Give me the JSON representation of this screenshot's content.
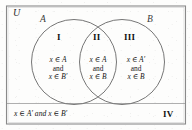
{
  "diagram": {
    "universe_label": "U",
    "set_a_label": "A",
    "set_b_label": "B",
    "colors": {
      "outline": "#7a7a7a",
      "circle_stroke": "#6f6f6f",
      "text": "#151515",
      "background": "#fdfdfc"
    },
    "regions": [
      {
        "numeral": "I",
        "name": "a-only",
        "line1": "x ∈ A",
        "line2": "and",
        "line3": "x ∈ B′"
      },
      {
        "numeral": "II",
        "name": "intersection",
        "line1": "x ∈ A",
        "line2": "and",
        "line3": "x ∈ B"
      },
      {
        "numeral": "III",
        "name": "b-only",
        "line1": "x ∈ A′",
        "line2": "and",
        "line3": "x ∈ B"
      },
      {
        "numeral": "IV",
        "name": "outside-both",
        "text": "x ∈ A′ and x ∈ B′"
      }
    ]
  }
}
